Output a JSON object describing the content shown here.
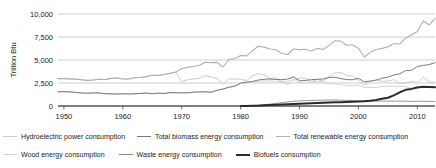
{
  "chart_data": {
    "type": "line",
    "title": "",
    "xlabel": "",
    "ylabel": "Trillion Btu",
    "xlim": [
      1949,
      2013
    ],
    "ylim": [
      0,
      10000
    ],
    "grid": true,
    "legend_position": "bottom",
    "ytick_labels": [
      "0",
      "2,500",
      "5,000",
      "7,500",
      "10,000"
    ],
    "ytick_values": [
      0,
      2500,
      5000,
      7500,
      10000
    ],
    "xtick_labels": [
      "1950",
      "1960",
      "1970",
      "1980",
      "1990",
      "2000",
      "2010"
    ],
    "xtick_values": [
      1950,
      1960,
      1970,
      1980,
      1990,
      2000,
      2010
    ],
    "x": [
      1949,
      1950,
      1951,
      1952,
      1953,
      1954,
      1955,
      1956,
      1957,
      1958,
      1959,
      1960,
      1961,
      1962,
      1963,
      1964,
      1965,
      1966,
      1967,
      1968,
      1969,
      1970,
      1971,
      1972,
      1973,
      1974,
      1975,
      1976,
      1977,
      1978,
      1979,
      1980,
      1981,
      1982,
      1983,
      1984,
      1985,
      1986,
      1987,
      1988,
      1989,
      1990,
      1991,
      1992,
      1993,
      1994,
      1995,
      1996,
      1997,
      1998,
      1999,
      2000,
      2001,
      2002,
      2003,
      2004,
      2005,
      2006,
      2007,
      2008,
      2009,
      2010,
      2011,
      2012,
      2013
    ],
    "series": [
      {
        "name": "Total renewable energy consumption",
        "color": "#b0b0b0",
        "width": 1.1,
        "values": [
          2974,
          2978,
          2950,
          2920,
          2850,
          2780,
          2830,
          2900,
          2880,
          3000,
          3050,
          2930,
          2930,
          3070,
          3100,
          3190,
          3350,
          3320,
          3430,
          3550,
          3700,
          4070,
          4200,
          4290,
          4430,
          4760,
          4720,
          4740,
          4240,
          5040,
          5170,
          5485,
          5450,
          6010,
          6500,
          6400,
          6200,
          6120,
          5700,
          5600,
          6200,
          6130,
          6160,
          5980,
          6260,
          6140,
          6560,
          7100,
          7050,
          6600,
          6650,
          6260,
          5328,
          5835,
          6150,
          6260,
          6410,
          6790,
          6720,
          7370,
          7750,
          8090,
          9240,
          8810,
          9500
        ]
      },
      {
        "name": "Total biomass energy consumption",
        "color": "#7a7a7a",
        "width": 1.0,
        "values": [
          1549,
          1562,
          1534,
          1474,
          1418,
          1396,
          1424,
          1415,
          1340,
          1322,
          1300,
          1320,
          1308,
          1330,
          1365,
          1410,
          1335,
          1390,
          1360,
          1450,
          1440,
          1431,
          1432,
          1503,
          1529,
          1540,
          1499,
          1713,
          1838,
          2038,
          2152,
          2475,
          2590,
          2663,
          2827,
          2900,
          2940,
          2880,
          2860,
          2930,
          3160,
          2735,
          2780,
          2860,
          2900,
          2930,
          3100,
          3120,
          2980,
          2870,
          2850,
          3010,
          2620,
          2710,
          2810,
          3020,
          3130,
          3370,
          3500,
          3840,
          3880,
          4290,
          4410,
          4500,
          4720
        ]
      },
      {
        "name": "Hydroelectric power consumption",
        "color": "#cdcdcd",
        "width": 1.0,
        "values": [
          2974,
          2978,
          2950,
          2920,
          2850,
          2780,
          2830,
          2900,
          2880,
          3000,
          3050,
          2930,
          2930,
          3070,
          3100,
          3190,
          3350,
          3320,
          3430,
          3550,
          3700,
          2650,
          2860,
          2930,
          3010,
          3310,
          3155,
          2976,
          2330,
          2937,
          2931,
          2900,
          2758,
          3266,
          3527,
          3386,
          2970,
          3071,
          2635,
          2334,
          2837,
          3046,
          3016,
          2617,
          2892,
          2690,
          3205,
          3590,
          3640,
          3297,
          3268,
          2811,
          2242,
          2689,
          2825,
          2690,
          2703,
          2869,
          2446,
          2512,
          2669,
          2539,
          3103,
          2629,
          2562
        ]
      },
      {
        "name": "Wood energy consumption",
        "color": "#d4d4d4",
        "width": 1.0,
        "values": [
          1549,
          1562,
          1534,
          1474,
          1418,
          1396,
          1424,
          1415,
          1340,
          1322,
          1300,
          1320,
          1308,
          1330,
          1365,
          1410,
          1335,
          1390,
          1360,
          1450,
          1440,
          1431,
          1432,
          1503,
          1529,
          1540,
          1499,
          1713,
          1838,
          2038,
          2152,
          2475,
          2590,
          2590,
          2690,
          2720,
          2740,
          2680,
          2660,
          2700,
          2900,
          2540,
          2580,
          2640,
          2630,
          2690,
          2370,
          2440,
          2320,
          2200,
          2220,
          2260,
          1995,
          2010,
          2000,
          2130,
          2140,
          2160,
          2120,
          2110,
          1890,
          2100,
          2120,
          2010,
          2160
        ]
      },
      {
        "name": "Waste energy consumption",
        "color": "#8a8a8a",
        "width": 0.9,
        "values": [
          null,
          null,
          null,
          null,
          null,
          null,
          null,
          null,
          null,
          null,
          null,
          null,
          null,
          null,
          null,
          null,
          null,
          null,
          null,
          null,
          null,
          null,
          null,
          null,
          null,
          null,
          null,
          null,
          null,
          null,
          null,
          10,
          20,
          40,
          80,
          140,
          200,
          280,
          360,
          440,
          520,
          560,
          580,
          600,
          620,
          630,
          650,
          660,
          630,
          610,
          600,
          590,
          560,
          540,
          530,
          540,
          530,
          530,
          540,
          520,
          500,
          510,
          510,
          500,
          500
        ]
      },
      {
        "name": "Biofuels consumption",
        "color": "#2b2b2b",
        "width": 2.0,
        "values": [
          null,
          null,
          null,
          null,
          null,
          null,
          null,
          null,
          null,
          null,
          null,
          null,
          null,
          null,
          null,
          null,
          null,
          null,
          null,
          null,
          null,
          null,
          null,
          null,
          null,
          null,
          null,
          null,
          null,
          null,
          null,
          0,
          10,
          20,
          40,
          70,
          110,
          140,
          170,
          200,
          230,
          250,
          270,
          300,
          330,
          360,
          380,
          400,
          420,
          440,
          460,
          480,
          520,
          580,
          660,
          780,
          900,
          1150,
          1480,
          1760,
          1860,
          2010,
          2080,
          2060,
          2040
        ]
      }
    ]
  },
  "legend": {
    "rows": [
      [
        {
          "label": "Hydroelectric power consumption",
          "color": "#cdcdcd",
          "width": 1.2,
          "name": "hydroelectric-power-consumption"
        },
        {
          "label": "Total biomass energy consumption",
          "color": "#7a7a7a",
          "width": 1.2,
          "name": "total-biomass-energy-consumption"
        },
        {
          "label": "Total renewable energy consumption",
          "color": "#b0b0b0",
          "width": 1.2,
          "name": "total-renewable-energy-consumption"
        }
      ],
      [
        {
          "label": "Wood energy consumption",
          "color": "#d4d4d4",
          "width": 1.2,
          "name": "wood-energy-consumption"
        },
        {
          "label": "Waste energy consumption",
          "color": "#8a8a8a",
          "width": 1.2,
          "name": "waste-energy-consumption"
        },
        {
          "label": "Biofuels consumption",
          "color": "#2b2b2b",
          "width": 2.4,
          "name": "biofuels-consumption"
        }
      ]
    ]
  },
  "axis": {
    "y_title": "Trillion Btu",
    "grid_color": "#b9b9b9",
    "axis_color": "#4a4a4a",
    "text_color": "#1a1a1a"
  }
}
